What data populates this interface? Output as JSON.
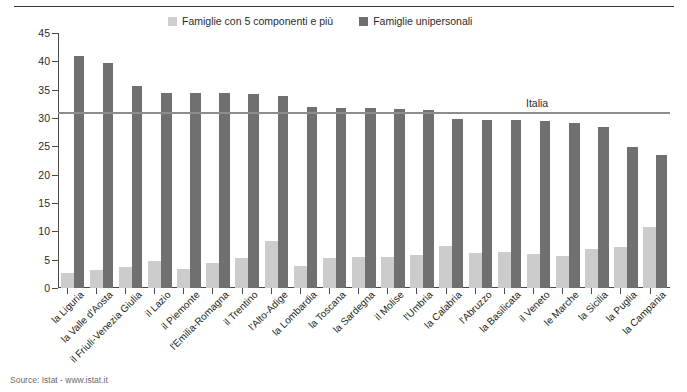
{
  "header": {
    "ghost_text": ""
  },
  "legend": {
    "position": "top-center",
    "items": [
      {
        "label": "Famiglie con 5 componenti e più",
        "color": "#cccccc",
        "icon": "legend-swatch-light"
      },
      {
        "label": "Famiglie unipersonali",
        "color": "#707070",
        "icon": "legend-swatch-dark"
      }
    ]
  },
  "footer": {
    "source": "Source: Istat - www.istat.it"
  },
  "chart_data": {
    "type": "bar",
    "title": "",
    "subtitle": "",
    "xlabel": "",
    "ylabel": "",
    "ylim": [
      0,
      45
    ],
    "yticks": [
      0,
      5,
      10,
      15,
      20,
      25,
      30,
      35,
      40,
      45
    ],
    "grid": false,
    "legend_position": "top-center",
    "categories": [
      "la Liguria",
      "la Valle d'Aosta",
      "il Friuli-Venezia Giulia",
      "il Lazio",
      "il Piemonte",
      "l'Emilia-Romagna",
      "il Trentino",
      "l'Alto-Adige",
      "la Lombardia",
      "la Toscana",
      "la Sardegna",
      "il Molise",
      "l'Umbria",
      "la Calabria",
      "l'Abruzzo",
      "la Basilicata",
      "il Veneto",
      "le Marche",
      "la Sicilia",
      "la Puglia",
      "la Campania"
    ],
    "series": [
      {
        "name": "Famiglie con 5 componenti e più",
        "color": "#cccccc",
        "values": [
          2.6,
          3.1,
          3.7,
          4.8,
          3.4,
          4.4,
          5.3,
          8.3,
          3.9,
          5.3,
          5.4,
          5.5,
          5.8,
          7.5,
          6.1,
          6.4,
          6.0,
          5.6,
          6.9,
          7.3,
          10.7
        ]
      },
      {
        "name": "Famiglie unipersonali",
        "color": "#707070",
        "values": [
          40.9,
          39.7,
          35.6,
          34.5,
          34.5,
          34.4,
          34.2,
          33.8,
          31.9,
          31.8,
          31.7,
          31.6,
          31.4,
          29.8,
          29.6,
          29.6,
          29.5,
          29.2,
          28.4,
          24.8,
          23.5
        ]
      }
    ],
    "reference_line": {
      "label": "Italia",
      "value": 31.0,
      "color": "#8d8d8d"
    }
  }
}
